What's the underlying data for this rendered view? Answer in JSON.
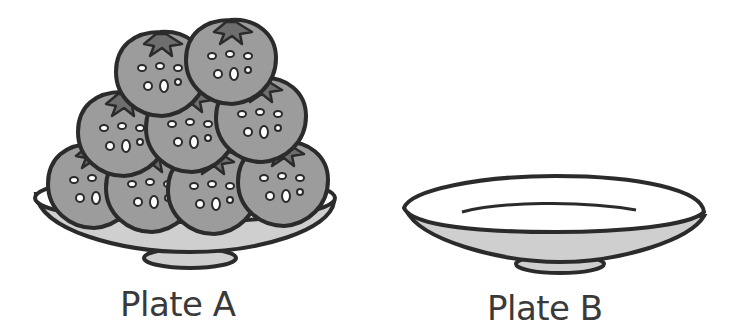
{
  "plates": [
    {
      "label": "Plate A",
      "strawberry_count": 9,
      "arrangement": {
        "bottom_row": 4,
        "middle_row": 3,
        "top_row": 2
      }
    },
    {
      "label": "Plate B",
      "strawberry_count": 0
    }
  ],
  "colors": {
    "outline": "#2b2b2b",
    "strawberry_fill": "#9c9c9c",
    "leaf_fill": "#6e6e6e",
    "plate_rim": "#ffffff",
    "plate_side": "#cfcfcf"
  }
}
